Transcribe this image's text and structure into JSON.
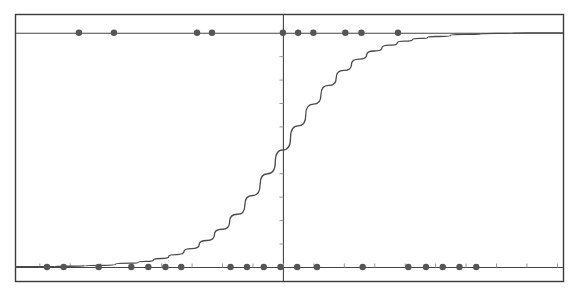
{
  "figure": {
    "background_color": "#ffffff",
    "width": 580,
    "height": 293
  },
  "axes": {
    "frame_color": "#3a3a3a",
    "frame": {
      "left": 15,
      "top": 14,
      "right": 563,
      "bottom": 281
    },
    "vertical_axis_label": "x = 0",
    "horizontal_line_top_label": "y = 1",
    "horizontal_line_bottom_label": "y = 0"
  },
  "style": {
    "point_color": "#555555",
    "curve_color": "#4a4a4a",
    "axis_line_color": "#444444",
    "tick_color": "#999999",
    "point_radius": 3.2,
    "curve_width": 1.3
  },
  "chart_data": {
    "type": "line",
    "title": "",
    "subtitle": "",
    "xlabel": "",
    "ylabel": "",
    "xlim": [
      -8.8,
      9.2
    ],
    "ylim": [
      -0.06,
      1.08
    ],
    "grid": false,
    "legend": null,
    "yticks": [
      0.0,
      0.1,
      0.2,
      0.3,
      0.4,
      0.5,
      0.6,
      0.7,
      0.8,
      0.9,
      1.0
    ],
    "ytick_labels": [
      "0.0",
      "0.1",
      "0.2",
      "0.3",
      "0.4",
      "0.5",
      "0.6",
      "0.7",
      "0.8",
      "0.9",
      "1.0"
    ],
    "xticks": [
      -8,
      -7,
      -6,
      -5,
      -4,
      -3,
      -2,
      -1,
      0,
      1,
      2,
      3,
      4,
      5,
      6,
      7,
      8,
      9
    ],
    "xtick_labels": [
      "-8",
      "-7",
      "-6",
      "-5",
      "-4",
      "-3",
      "-2",
      "-1",
      "0",
      "1",
      "2",
      "3",
      "4",
      "5",
      "6",
      "7",
      "8",
      "9"
    ],
    "reference_lines": [
      {
        "name": "y-one-line",
        "orientation": "horizontal",
        "value": 1.0
      },
      {
        "name": "y-zero-line",
        "orientation": "horizontal",
        "value": 0.0
      },
      {
        "name": "x-zero-line",
        "orientation": "vertical",
        "value": 0.0
      }
    ],
    "series": [
      {
        "name": "logistic-fit-curve",
        "type": "line",
        "function": "sigmoid",
        "midpoint": 0.0,
        "steepness": 0.82,
        "x": [
          -8.8,
          -8.0,
          -7.0,
          -6.0,
          -5.0,
          -4.5,
          -4.0,
          -3.5,
          -3.0,
          -2.5,
          -2.0,
          -1.5,
          -1.0,
          -0.5,
          0.0,
          0.5,
          1.0,
          1.5,
          2.0,
          2.5,
          3.0,
          3.5,
          4.0,
          4.5,
          5.0,
          6.0,
          7.0,
          8.0,
          9.2
        ],
        "y": [
          0.001,
          0.001,
          0.003,
          0.007,
          0.016,
          0.024,
          0.036,
          0.053,
          0.078,
          0.113,
          0.161,
          0.225,
          0.305,
          0.398,
          0.5,
          0.602,
          0.695,
          0.775,
          0.839,
          0.887,
          0.922,
          0.947,
          0.964,
          0.976,
          0.984,
          0.993,
          0.997,
          0.999,
          0.999
        ]
      },
      {
        "name": "class-0-observations",
        "type": "scatter",
        "class_value": 0,
        "x": [
          -7.75,
          -7.2,
          -6.05,
          -4.98,
          -4.42,
          -3.86,
          -3.34,
          -1.72,
          -1.18,
          -0.63,
          -0.08,
          0.47,
          1.12,
          2.62,
          4.12,
          4.7,
          5.25,
          5.8,
          6.35
        ],
        "y": [
          0,
          0,
          0,
          0,
          0,
          0,
          0,
          0,
          0,
          0,
          0,
          0,
          0,
          0,
          0,
          0,
          0,
          0,
          0
        ]
      },
      {
        "name": "class-1-observations",
        "type": "scatter",
        "class_value": 1,
        "x": [
          -6.7,
          -5.55,
          -2.82,
          -2.33,
          0.0,
          0.5,
          1.0,
          2.05,
          2.58,
          3.78
        ],
        "y": [
          1,
          1,
          1,
          1,
          1,
          1,
          1,
          1,
          1,
          1
        ]
      }
    ]
  }
}
